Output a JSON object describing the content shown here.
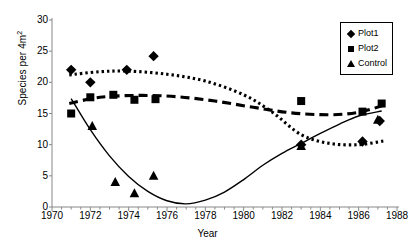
{
  "chart_data": {
    "type": "scatter",
    "title": "",
    "xlabel": "Year",
    "ylabel": "Species per 4m",
    "ylabel_sup": "2",
    "xlim": [
      1970,
      1988
    ],
    "ylim": [
      0,
      30
    ],
    "xticks": [
      1970,
      1972,
      1974,
      1976,
      1978,
      1980,
      1982,
      1984,
      1986,
      1988
    ],
    "yticks": [
      0,
      5,
      10,
      15,
      20,
      25,
      30
    ],
    "grid": false,
    "legend_position": "top-right",
    "series": [
      {
        "name": "Plot1",
        "marker": "diamond",
        "trend_style": "dotted",
        "points": [
          {
            "x": 1971.0,
            "y": 22.0
          },
          {
            "x": 1972.0,
            "y": 20.0
          },
          {
            "x": 1973.9,
            "y": 22.0
          },
          {
            "x": 1975.3,
            "y": 24.2
          },
          {
            "x": 1983.0,
            "y": 10.0
          },
          {
            "x": 1986.2,
            "y": 10.5
          },
          {
            "x": 1987.1,
            "y": 13.8
          }
        ],
        "trend": [
          {
            "x": 1970.9,
            "y": 21.2
          },
          {
            "x": 1972.5,
            "y": 21.7
          },
          {
            "x": 1974.0,
            "y": 21.8
          },
          {
            "x": 1976.0,
            "y": 21.3
          },
          {
            "x": 1978.0,
            "y": 20.2
          },
          {
            "x": 1980.0,
            "y": 18.0
          },
          {
            "x": 1981.5,
            "y": 15.2
          },
          {
            "x": 1983.0,
            "y": 11.6
          },
          {
            "x": 1984.5,
            "y": 10.2
          },
          {
            "x": 1986.0,
            "y": 10.0
          },
          {
            "x": 1987.3,
            "y": 10.6
          }
        ]
      },
      {
        "name": "Plot2",
        "marker": "square",
        "trend_style": "dashed",
        "points": [
          {
            "x": 1971.0,
            "y": 15.0
          },
          {
            "x": 1972.0,
            "y": 17.6
          },
          {
            "x": 1973.2,
            "y": 18.0
          },
          {
            "x": 1974.3,
            "y": 17.2
          },
          {
            "x": 1975.4,
            "y": 17.3
          },
          {
            "x": 1983.0,
            "y": 17.0
          },
          {
            "x": 1986.2,
            "y": 15.3
          },
          {
            "x": 1987.2,
            "y": 16.6
          }
        ],
        "trend": [
          {
            "x": 1970.9,
            "y": 16.6
          },
          {
            "x": 1972.5,
            "y": 17.6
          },
          {
            "x": 1974.5,
            "y": 17.9
          },
          {
            "x": 1976.5,
            "y": 17.7
          },
          {
            "x": 1978.5,
            "y": 17.0
          },
          {
            "x": 1980.5,
            "y": 16.0
          },
          {
            "x": 1982.5,
            "y": 15.1
          },
          {
            "x": 1984.5,
            "y": 14.8
          },
          {
            "x": 1986.0,
            "y": 15.2
          },
          {
            "x": 1987.4,
            "y": 16.4
          }
        ]
      },
      {
        "name": "Control",
        "marker": "triangle",
        "trend_style": "solid",
        "points": [
          {
            "x": 1972.1,
            "y": 13.0
          },
          {
            "x": 1973.3,
            "y": 4.0
          },
          {
            "x": 1974.3,
            "y": 2.2
          },
          {
            "x": 1975.3,
            "y": 5.0
          },
          {
            "x": 1983.0,
            "y": 9.8
          },
          {
            "x": 1987.0,
            "y": 14.0
          }
        ],
        "trend": [
          {
            "x": 1971.0,
            "y": 17.4
          },
          {
            "x": 1972.0,
            "y": 12.4
          },
          {
            "x": 1973.0,
            "y": 8.2
          },
          {
            "x": 1974.0,
            "y": 4.9
          },
          {
            "x": 1975.0,
            "y": 2.5
          },
          {
            "x": 1976.0,
            "y": 1.0
          },
          {
            "x": 1977.0,
            "y": 0.5
          },
          {
            "x": 1978.0,
            "y": 1.1
          },
          {
            "x": 1979.0,
            "y": 2.4
          },
          {
            "x": 1980.0,
            "y": 4.4
          },
          {
            "x": 1981.0,
            "y": 6.7
          },
          {
            "x": 1982.0,
            "y": 8.6
          },
          {
            "x": 1983.0,
            "y": 10.2
          },
          {
            "x": 1984.0,
            "y": 11.8
          },
          {
            "x": 1985.0,
            "y": 13.3
          },
          {
            "x": 1986.0,
            "y": 14.6
          },
          {
            "x": 1987.2,
            "y": 15.4
          }
        ]
      }
    ]
  },
  "legend": {
    "items": [
      {
        "label": "Plot1",
        "marker": "diamond"
      },
      {
        "label": "Plot2",
        "marker": "square"
      },
      {
        "label": "Control",
        "marker": "triangle"
      }
    ]
  }
}
